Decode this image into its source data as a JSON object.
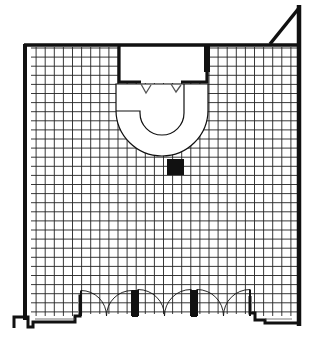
{
  "drawing": {
    "type": "architectural floor plan",
    "description": "Store floor plan with tiled grid floor, back room, U-shaped service counter, structural column and storefront with multiple double doors",
    "colors": {
      "ink": "#111111",
      "paper": "#ffffff"
    },
    "elements": [
      "exterior-walls",
      "corner-triangle",
      "back-room",
      "u-shaped-counter",
      "column",
      "storefront-doors",
      "floor-grid"
    ],
    "door_count": 6
  }
}
